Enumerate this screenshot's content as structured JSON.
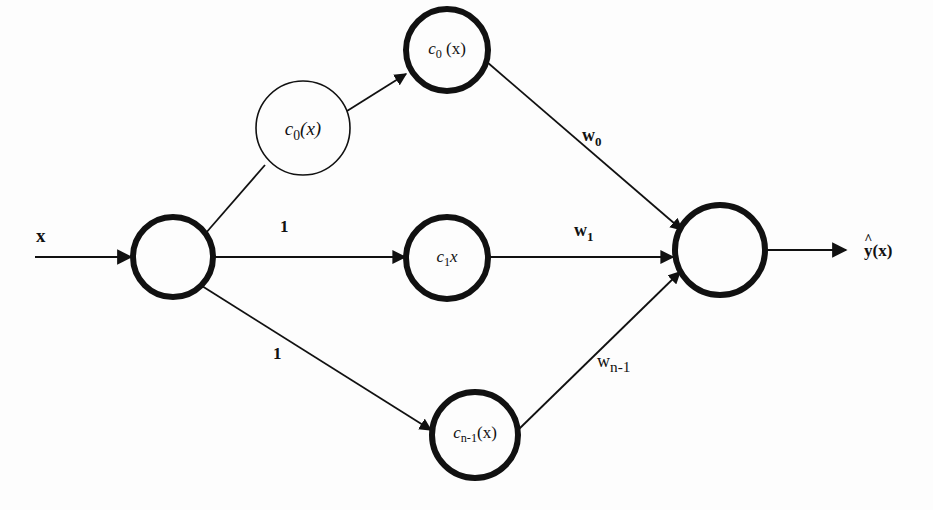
{
  "diagram": {
    "type": "network",
    "input": {
      "label": "x"
    },
    "output": {
      "label_base": "y",
      "label_hat": "^",
      "label_arg": "(x)"
    },
    "nodes": {
      "input_node": {
        "label": ""
      },
      "helper_node": {
        "base": "c",
        "sub": "0",
        "arg": "(x)"
      },
      "top_node": {
        "base": "c",
        "sub": "0",
        "arg": " (x)"
      },
      "middle_node": {
        "base": "c",
        "sub": "1",
        "arg": "x"
      },
      "bottom_node": {
        "base": "c",
        "sub": "n-1",
        "arg": "(x)"
      },
      "output_node": {
        "label": ""
      }
    },
    "edges": {
      "input_to_middle_weight": "1",
      "input_to_bottom_weight": "1",
      "top_to_output": {
        "base": "w",
        "sub": "0"
      },
      "middle_to_output": {
        "base": "w",
        "sub": "1"
      },
      "bottom_to_output": {
        "base": "w",
        "sub": "n-1"
      }
    },
    "colors": {
      "stroke": "#111111",
      "background": "#fdfdfd"
    }
  }
}
